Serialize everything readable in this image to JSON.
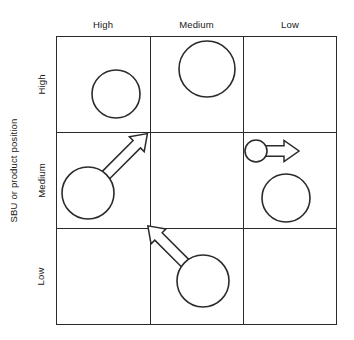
{
  "diagram": {
    "type": "matrix-bubble-diagram",
    "y_axis_title": "SBU or product position",
    "column_headers": [
      "High",
      "Medium",
      "Low"
    ],
    "row_labels": [
      "High",
      "Medium",
      "Low"
    ],
    "grid": {
      "rows": 3,
      "columns": 3,
      "line_color": "#2b2b2b",
      "background": "#ffffff"
    },
    "cells": [
      {
        "row": "High",
        "column": "High",
        "name": "cell-high-high",
        "bubbles": [
          {
            "cx": 116,
            "cy": 94,
            "r": 24
          }
        ],
        "arrows": []
      },
      {
        "row": "High",
        "column": "Medium",
        "name": "cell-high-medium",
        "bubbles": [
          {
            "cx": 207,
            "cy": 69,
            "r": 28
          }
        ],
        "arrows": []
      },
      {
        "row": "High",
        "column": "Low",
        "name": "cell-high-low",
        "bubbles": [],
        "arrows": []
      },
      {
        "row": "Medium",
        "column": "High",
        "name": "cell-medium-high",
        "bubbles": [
          {
            "cx": 88,
            "cy": 193,
            "r": 26
          }
        ],
        "arrows": [
          {
            "direction": "up-right",
            "angle_deg": -45,
            "length": 58,
            "style": "hollow-outline"
          }
        ]
      },
      {
        "row": "Medium",
        "column": "Medium",
        "name": "cell-medium-medium",
        "bubbles": [],
        "arrows": []
      },
      {
        "row": "Medium",
        "column": "Low",
        "name": "cell-medium-low",
        "bubbles": [
          {
            "cx": 256,
            "cy": 151,
            "r": 11
          },
          {
            "cx": 286,
            "cy": 198,
            "r": 24
          }
        ],
        "arrows": [
          {
            "direction": "right",
            "angle_deg": 0,
            "length": 32,
            "style": "hollow-outline"
          }
        ]
      },
      {
        "row": "Low",
        "column": "High",
        "name": "cell-low-high",
        "bubbles": [],
        "arrows": []
      },
      {
        "row": "Low",
        "column": "Medium",
        "name": "cell-low-medium",
        "bubbles": [
          {
            "cx": 203,
            "cy": 281,
            "r": 26
          }
        ],
        "arrows": [
          {
            "direction": "up-left",
            "angle_deg": -135,
            "length": 52,
            "style": "hollow-outline"
          }
        ]
      },
      {
        "row": "Low",
        "column": "Low",
        "name": "cell-low-low",
        "bubbles": [],
        "arrows": []
      }
    ]
  }
}
